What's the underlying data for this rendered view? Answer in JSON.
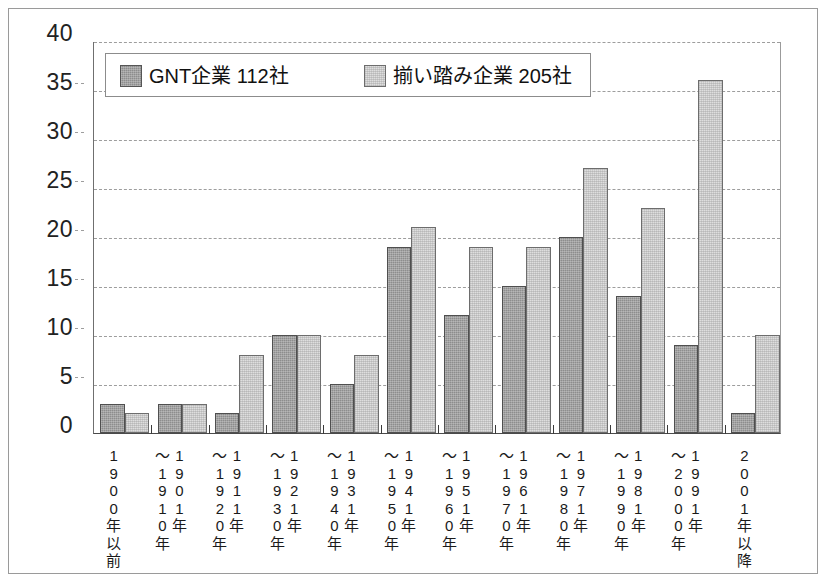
{
  "chart_data": {
    "type": "bar",
    "title": "",
    "subtitle": "",
    "xlabel": "",
    "ylabel": "",
    "ylim": [
      0,
      40
    ],
    "ytick_values": [
      0,
      5,
      10,
      15,
      20,
      25,
      30,
      35,
      40
    ],
    "ytick_labels": [
      "0",
      "5",
      "10",
      "15",
      "20",
      "25",
      "30",
      "35",
      "40"
    ],
    "grid": true,
    "grid_style": "dashed-horizontal",
    "legend_position": "top-left-inside",
    "categories": [
      "1900年以前",
      "1901年〜1910年",
      "1911年〜1920年",
      "1921年〜1930年",
      "1931年〜1940年",
      "1941年〜1950年",
      "1951年〜1960年",
      "1961年〜1970年",
      "1971年〜1980年",
      "1981年〜1990年",
      "1991年〜2000年",
      "2001年以降"
    ],
    "category_columns": [
      [
        [
          "1",
          "9",
          "0",
          "0",
          "年",
          "以",
          "前"
        ]
      ],
      [
        [
          "〜",
          "1",
          "9",
          "1",
          "0",
          "年"
        ],
        [
          "1",
          "9",
          "0",
          "1",
          "年"
        ]
      ],
      [
        [
          "〜",
          "1",
          "9",
          "2",
          "0",
          "年"
        ],
        [
          "1",
          "9",
          "1",
          "1",
          "年"
        ]
      ],
      [
        [
          "〜",
          "1",
          "9",
          "3",
          "0",
          "年"
        ],
        [
          "1",
          "9",
          "2",
          "1",
          "年"
        ]
      ],
      [
        [
          "〜",
          "1",
          "9",
          "4",
          "0",
          "年"
        ],
        [
          "1",
          "9",
          "3",
          "1",
          "年"
        ]
      ],
      [
        [
          "〜",
          "1",
          "9",
          "5",
          "0",
          "年"
        ],
        [
          "1",
          "9",
          "4",
          "1",
          "年"
        ]
      ],
      [
        [
          "〜",
          "1",
          "9",
          "6",
          "0",
          "年"
        ],
        [
          "1",
          "9",
          "5",
          "1",
          "年"
        ]
      ],
      [
        [
          "〜",
          "1",
          "9",
          "7",
          "0",
          "年"
        ],
        [
          "1",
          "9",
          "6",
          "1",
          "年"
        ]
      ],
      [
        [
          "〜",
          "1",
          "9",
          "8",
          "0",
          "年"
        ],
        [
          "1",
          "9",
          "7",
          "1",
          "年"
        ]
      ],
      [
        [
          "〜",
          "1",
          "9",
          "9",
          "0",
          "年"
        ],
        [
          "1",
          "9",
          "8",
          "1",
          "年"
        ]
      ],
      [
        [
          "〜",
          "2",
          "0",
          "0",
          "0",
          "年"
        ],
        [
          "1",
          "9",
          "9",
          "1",
          "年"
        ]
      ],
      [
        [
          "2",
          "0",
          "0",
          "1",
          "年",
          "以",
          "降"
        ]
      ]
    ],
    "series": [
      {
        "name": "GNT企業 112社",
        "color": "#8d8d8d",
        "values": [
          3,
          3,
          2,
          10,
          5,
          19,
          12,
          15,
          20,
          14,
          9,
          2
        ]
      },
      {
        "name": "揃い踏み企業 205社",
        "color": "#dedede",
        "values": [
          2,
          3,
          8,
          10,
          8,
          21,
          19,
          19,
          27,
          23,
          36,
          10
        ]
      }
    ]
  },
  "legend": {
    "entries": [
      {
        "label": "GNT企業 112社",
        "swatch": "series-0-swatch"
      },
      {
        "label": "揃い踏み企業 205社",
        "swatch": "series-1-swatch"
      }
    ]
  }
}
